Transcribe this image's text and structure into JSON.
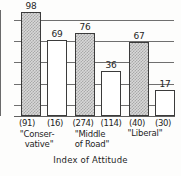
{
  "chart_data": {
    "type": "bar",
    "title": "",
    "xlabel": "Index of Attitude",
    "ylabel": "",
    "ylim": [
      0,
      100
    ],
    "grid": true,
    "legend_position": "none",
    "gridline_values": [
      100,
      80,
      60,
      40,
      20
    ],
    "categories": [
      "\"Conser-\nvative\"",
      "\"Middle\nof Road\"",
      "\"Liberal\""
    ],
    "bars": [
      {
        "value": 98,
        "value_label": "98",
        "count_label": "(91)",
        "count": 91,
        "fill": "shaded"
      },
      {
        "value": 69,
        "value_label": "69",
        "count_label": "(16)",
        "count": 16,
        "fill": "plain"
      },
      {
        "value": 76,
        "value_label": "76",
        "count_label": "(274)",
        "count": 274,
        "fill": "shaded"
      },
      {
        "value": 36,
        "value_label": "36",
        "count_label": "(114)",
        "count": 114,
        "fill": "plain"
      },
      {
        "value": 67,
        "value_label": "67",
        "count_label": "(40)",
        "count": 40,
        "fill": "shaded"
      },
      {
        "value": 17,
        "value_label": "17",
        "count_label": "(30)",
        "count": 30,
        "fill": "plain"
      }
    ],
    "series": [
      {
        "name": "shaded",
        "values": [
          98,
          76,
          67
        ]
      },
      {
        "name": "plain",
        "values": [
          69,
          36,
          17
        ]
      }
    ],
    "colors": {
      "shaded_fill": "#d8d8d8",
      "shaded_pattern": "#a8a8a8",
      "plain_fill": "#ffffff",
      "bar_outline": "#3b3b3b",
      "gridline": "#6f6f6f",
      "text": "#1e1e1e",
      "background": "#fdfdfc"
    }
  },
  "axis": {
    "title": "Index of Attitude"
  },
  "values": {
    "b0": "98",
    "b1": "69",
    "b2": "76",
    "b3": "36",
    "b4": "67",
    "b5": "17"
  },
  "counts": {
    "c0": "(91)",
    "c1": "(16)",
    "c2": "(274)",
    "c3": "(114)",
    "c4": "(40)",
    "c5": "(30)"
  },
  "groups": {
    "g0_l1": "\"Conser-",
    "g0_l2": "vative\"",
    "g1_l1": "\"Middle",
    "g1_l2": "of Road\"",
    "g2_l1": "\"Liberal\"",
    "g2_l2": ""
  }
}
